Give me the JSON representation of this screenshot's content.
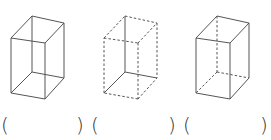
{
  "figure": {
    "line_color": "#555555",
    "boxes": [
      {
        "id": "box-1",
        "style": "all edges solid",
        "offset_x": 0,
        "vertices": {
          "back_top_left": [
            32,
            16
          ],
          "back_top_right": [
            64,
            23
          ],
          "front_top_left": [
            11,
            38
          ],
          "front_top_right": [
            45,
            43
          ],
          "back_bottom_left": [
            32,
            72
          ],
          "back_bottom_right": [
            64,
            78
          ],
          "front_bottom_left": [
            11,
            93
          ],
          "front_bottom_right": [
            45,
            99
          ]
        }
      },
      {
        "id": "box-2",
        "style": "hidden edges solid, visible edges dashed",
        "offset_x": 93
      },
      {
        "id": "box-3",
        "style": "visible edges solid, hidden edges dashed",
        "offset_x": 185
      }
    ],
    "answer_blanks": [
      {
        "open": "(",
        "close": ")",
        "x_open": 1,
        "x_close": 76
      },
      {
        "open": "(",
        "close": ")",
        "x_open": 91,
        "x_close": 168
      },
      {
        "open": "(",
        "close": ")",
        "x_open": 183,
        "x_close": 260
      }
    ]
  }
}
